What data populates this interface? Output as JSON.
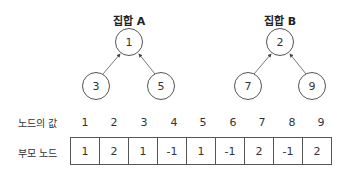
{
  "sets": [
    {
      "title": "집합 A",
      "root": {
        "value": "1",
        "cx": 129,
        "cy": 42
      },
      "children": [
        {
          "value": "3",
          "cx": 96,
          "cy": 86
        },
        {
          "value": "5",
          "cx": 161,
          "cy": 86
        }
      ]
    },
    {
      "title": "집합 B",
      "root": {
        "value": "2",
        "cx": 280,
        "cy": 42
      },
      "children": [
        {
          "value": "7",
          "cx": 248,
          "cy": 86
        },
        {
          "value": "9",
          "cx": 312,
          "cy": 86
        }
      ]
    }
  ],
  "table": {
    "value_row_label": "노드의 값",
    "parent_row_label": "부모 노드",
    "node_values": [
      "1",
      "2",
      "3",
      "4",
      "5",
      "6",
      "7",
      "8",
      "9"
    ],
    "parent_values": [
      "1",
      "2",
      "1",
      "-1",
      "1",
      "-1",
      "2",
      "-1",
      "2"
    ]
  }
}
